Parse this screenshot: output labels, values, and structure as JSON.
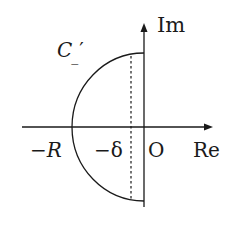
{
  "diagram": {
    "type": "complex-plane contour",
    "colors": {
      "stroke": "#1a1a1a",
      "background": "#ffffff"
    },
    "axes": {
      "imaginary_label": "Im",
      "real_label": "Re",
      "origin_label": "O"
    },
    "contour": {
      "label_main": "C",
      "label_sub": "_",
      "label_prime": "′",
      "shape": "left half-disc of radius R closed by the imaginary axis"
    },
    "real_axis_marks": [
      {
        "id": "minus-R",
        "label": "−R"
      },
      {
        "id": "minus-delta",
        "label": "−δ"
      }
    ],
    "dotted_line": {
      "at": "−δ",
      "style": "dotted vertical"
    }
  }
}
